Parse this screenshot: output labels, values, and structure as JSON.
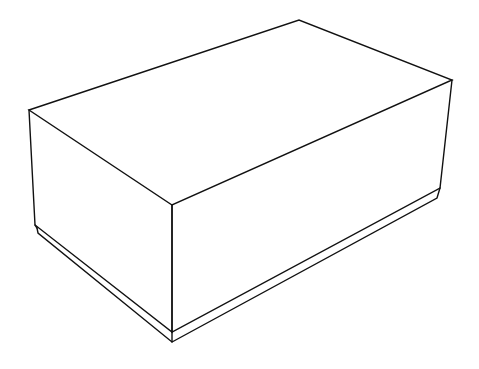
{
  "diagram": {
    "type": "isometric-box-line-drawing",
    "stroke_color": "#111111",
    "background": "#ffffff",
    "vertices": {
      "top_left": [
        29,
        110
      ],
      "top_back": [
        299,
        20
      ],
      "top_right": [
        452,
        80
      ],
      "top_front": [
        172,
        205
      ],
      "box_bottom_left": [
        35,
        225
      ],
      "box_bottom_front": [
        172,
        332
      ],
      "box_bottom_right": [
        440,
        188
      ],
      "plate_bottom_left": [
        38,
        233
      ],
      "plate_bottom_front": [
        172,
        342
      ],
      "plate_bottom_right": [
        437,
        198
      ]
    }
  }
}
